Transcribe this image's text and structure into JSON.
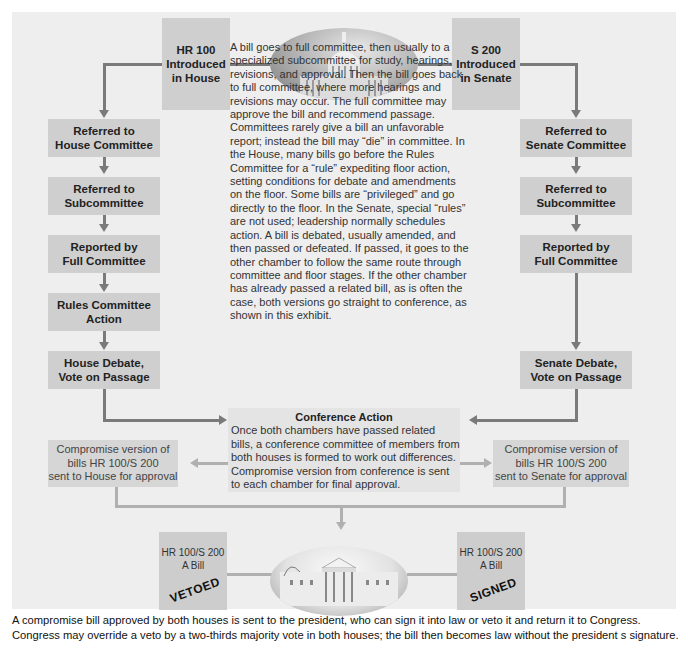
{
  "diagram": {
    "house_start": {
      "line1": "HR 100",
      "line2": "Introduced",
      "line3": "in House"
    },
    "senate_start": {
      "line1": "S 200",
      "line2": "Introduced",
      "line3": "in Senate"
    },
    "house_steps": [
      {
        "line1": "Referred to",
        "line2": "House Committee"
      },
      {
        "line1": "Referred to",
        "line2": "Subcommittee"
      },
      {
        "line1": "Reported by",
        "line2": "Full Committee"
      },
      {
        "line1": "Rules Committee",
        "line2": "Action"
      },
      {
        "line1": "House Debate,",
        "line2": "Vote on Passage"
      }
    ],
    "senate_steps": [
      {
        "line1": "Referred to",
        "line2": "Senate Committee"
      },
      {
        "line1": "Referred to",
        "line2": "Subcommittee"
      },
      {
        "line1": "Reported by",
        "line2": "Full Committee"
      },
      {
        "line1": "Senate Debate,",
        "line2": "Vote on Passage"
      }
    ],
    "description": "A bill goes to full committee, then usually to a specialized subcommittee for study, hearings, revisions, and approval. Then the bill goes back to full committee, where more hearings and revisions may occur. The full committee may approve the bill and recommend passage. Committees rarely give a bill an unfavorable report; instead the bill may “die” in committee. In the House, many bills go before the Rules Committee for a “rule” expediting floor action, setting conditions for debate and amendments on the floor. Some bills are “privileged” and go directly to the floor. In the Senate, special “rules” are not used; leadership normally schedules action. A bill is debated, usually amended, and then passed or defeated. If passed, it goes to the other chamber to follow the same route through committee and floor stages. If the other chamber has already passed a related bill, as is often the case, both versions go straight to conference, as shown in this exhibit.",
    "conference": {
      "title": "Conference Action",
      "body": "Once both chambers have passed related bills, a conference committee of members from both houses is formed to work out differences. Compromise version from conference is sent to each chamber for final approval."
    },
    "compromise_house": {
      "line1": "Compromise version of",
      "line2": "bills HR 100/S 200",
      "line3": "sent to House for approval"
    },
    "compromise_senate": {
      "line1": "Compromise version of",
      "line2": "bills HR 100/S 200",
      "line3": "sent to Senate for approval"
    },
    "bill_vetoed": {
      "line1": "HR 100/S 200",
      "line2": "A Bill",
      "stamp": "VETOED"
    },
    "bill_signed": {
      "line1": "HR 100/S 200",
      "line2": "A Bill",
      "stamp": "SIGNED"
    },
    "images": {
      "top": "capitol-building",
      "bottom": "white-house"
    },
    "caption": {
      "line1": "A compromise bill approved by both houses is sent to the president, who can sign it into law or veto it and return it to Congress.",
      "line2": "Congress may override a veto by a two-thirds majority vote in both houses; the bill then becomes law without the president s signature."
    },
    "colors": {
      "panel": "#eeeeee",
      "box": "#cfcfcf",
      "arrow": "#7a7a7a",
      "light_arrow": "#b0b0b0"
    }
  }
}
